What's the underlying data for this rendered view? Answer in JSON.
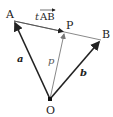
{
  "diagram": {
    "points": {
      "A": {
        "label": "A"
      },
      "B": {
        "label": "B"
      },
      "P": {
        "label": "P"
      },
      "O": {
        "label": "O"
      }
    },
    "vectors": {
      "a": {
        "label": "a",
        "from": "O",
        "to": "A"
      },
      "b": {
        "label": "b",
        "from": "O",
        "to": "B"
      },
      "p": {
        "label": "p",
        "from": "O",
        "to": "P"
      },
      "tAB": {
        "label_t": "t",
        "label_AB": "AB",
        "from": "A",
        "to": "P"
      }
    },
    "colors": {
      "line": "#2a2a2a",
      "p_line": "#8a8a8a",
      "segment": "#7a7a7a"
    }
  }
}
